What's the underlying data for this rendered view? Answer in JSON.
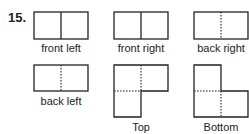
{
  "problem": {
    "number": "15."
  },
  "views": [
    {
      "label": "front left"
    },
    {
      "label": "front right"
    },
    {
      "label": "back right"
    },
    {
      "label": "back left"
    },
    {
      "label": "Top"
    },
    {
      "label": "Bottom"
    }
  ]
}
